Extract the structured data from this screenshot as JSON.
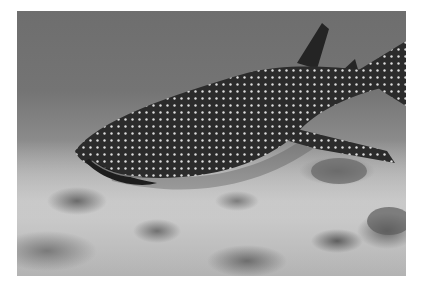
{
  "image": {
    "subject": "whale shark swimming over coral seabed",
    "style": "grayscale underwater photograph",
    "colors": {
      "background": "#ffffff",
      "water": "#747474",
      "sand": "#c8c8c8",
      "shark_body": "#2a2a2a",
      "spots": "#e6e6e6"
    }
  }
}
